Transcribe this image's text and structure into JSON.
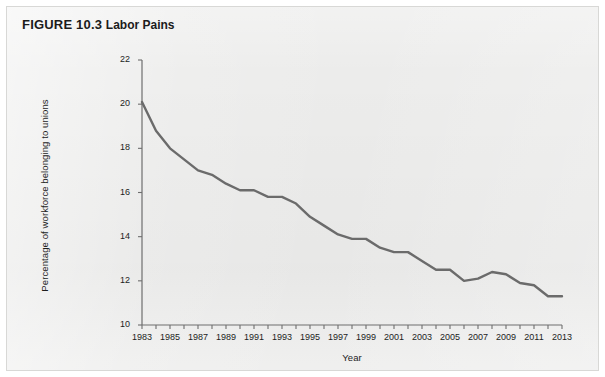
{
  "figure": {
    "number_label": "FIGURE 10.3",
    "title": "Labor Pains"
  },
  "chart_data": {
    "type": "line",
    "title": "Labor Pains",
    "xlabel": "Year",
    "ylabel": "Percentage of workforce belonging to unions",
    "xlim": [
      1983,
      2013
    ],
    "ylim": [
      10,
      22
    ],
    "ytick_step": 2,
    "xtick_step": 2,
    "grid": false,
    "legend": null,
    "line_color": "#6b6b6b",
    "x": [
      1983,
      1984,
      1985,
      1986,
      1987,
      1988,
      1989,
      1990,
      1991,
      1992,
      1993,
      1994,
      1995,
      1996,
      1997,
      1998,
      1999,
      2000,
      2001,
      2002,
      2003,
      2004,
      2005,
      2006,
      2007,
      2008,
      2009,
      2010,
      2011,
      2012,
      2013
    ],
    "values": [
      20.1,
      18.8,
      18.0,
      17.5,
      17.0,
      16.8,
      16.4,
      16.1,
      16.1,
      15.8,
      15.8,
      15.5,
      14.9,
      14.5,
      14.1,
      13.9,
      13.9,
      13.5,
      13.3,
      13.3,
      12.9,
      12.5,
      12.5,
      12.0,
      12.1,
      12.4,
      12.3,
      11.9,
      11.8,
      11.3,
      11.3
    ],
    "ytick_labels": [
      "22",
      "20",
      "18",
      "16",
      "14",
      "12",
      "10"
    ],
    "xtick_labels": [
      "1983",
      "1985",
      "1987",
      "1989",
      "1991",
      "1993",
      "1995",
      "1997",
      "1999",
      "2001",
      "2003",
      "2005",
      "2007",
      "2009",
      "2011",
      "2013"
    ]
  }
}
